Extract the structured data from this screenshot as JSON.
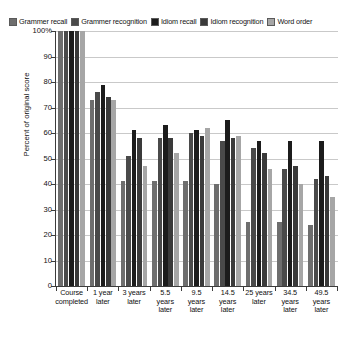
{
  "chart_data": {
    "type": "bar",
    "title": "",
    "xlabel": "",
    "ylabel": "Percent of original score",
    "ylim": [
      0,
      100
    ],
    "grid": true,
    "legend_position": "top",
    "categories": [
      "Course completed",
      "1 year later",
      "3 years later",
      "5.5 years later",
      "9.5 years later",
      "14.5 years later",
      "25 years later",
      "34.5 years later",
      "49.5 years later"
    ],
    "category_lines": [
      [
        "Course",
        "completed"
      ],
      [
        "1 year",
        "later"
      ],
      [
        "3 years",
        "later"
      ],
      [
        "5.5",
        "years",
        "later"
      ],
      [
        "9.5",
        "years",
        "later"
      ],
      [
        "14.5",
        "years",
        "later"
      ],
      [
        "25 years",
        "later"
      ],
      [
        "34.5",
        "years",
        "later"
      ],
      [
        "49.5",
        "years",
        "later"
      ]
    ],
    "y_ticks": [
      "0",
      "10",
      "20",
      "30",
      "40",
      "50",
      "60",
      "70",
      "80",
      "90",
      "100%"
    ],
    "series": [
      {
        "name": "Grammer recall",
        "color": "#6e6e6e",
        "values": [
          100,
          73,
          41,
          41,
          41,
          40,
          25,
          25,
          24
        ]
      },
      {
        "name": "Grammer recognition",
        "color": "#4a4a4a",
        "values": [
          100,
          76,
          51,
          58,
          60,
          57,
          54,
          46,
          42
        ]
      },
      {
        "name": "Idiom recall",
        "color": "#1c1c1c",
        "values": [
          100,
          79,
          61,
          63,
          61,
          65,
          57,
          57,
          57
        ]
      },
      {
        "name": "Idiom recognition",
        "color": "#3a3a3a",
        "values": [
          100,
          74,
          58,
          58,
          59,
          58,
          52,
          47,
          43
        ]
      },
      {
        "name": "Word order",
        "color": "#a6a6a6",
        "values": [
          100,
          73,
          47,
          52,
          62,
          59,
          46,
          40,
          35
        ]
      }
    ]
  }
}
